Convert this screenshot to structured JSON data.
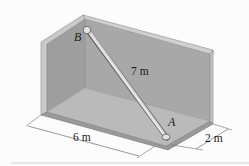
{
  "figure": {
    "points": [
      {
        "id": "A",
        "label": "A"
      },
      {
        "id": "B",
        "label": "B"
      }
    ],
    "dimensions": {
      "rod_length": "7 m",
      "floor_length": "6 m",
      "floor_width": "2 m"
    }
  },
  "colors": {
    "wall_face": "#a9a9a9",
    "wall_edge": "#cfcfcf",
    "floor": "#b9b9b9",
    "rod": "#d4d4d4",
    "dimension_line": "#555555"
  }
}
